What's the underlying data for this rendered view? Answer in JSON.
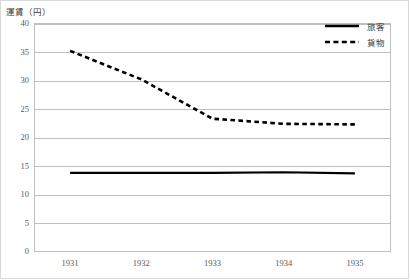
{
  "chart_data": {
    "type": "line",
    "title": "",
    "ylabel": "運賃（円）",
    "xlabel": "",
    "categories": [
      "1931",
      "1932",
      "1933",
      "1934",
      "1935"
    ],
    "x": [
      1931,
      1932,
      1933,
      1934,
      1935
    ],
    "ylim": [
      0,
      40
    ],
    "ytick_values": [
      0,
      5,
      10,
      15,
      20,
      25,
      30,
      35,
      40
    ],
    "ytick_labels": [
      "0",
      "5",
      "10",
      "15",
      "20",
      "25",
      "30",
      "35",
      "40"
    ],
    "grid": "horizontal",
    "legend_position": "top-right",
    "series": [
      {
        "name": "旅客",
        "style": "solid",
        "color": "#000000",
        "values": [
          13.8,
          13.8,
          13.8,
          13.9,
          13.7
        ]
      },
      {
        "name": "貨物",
        "style": "dashed",
        "color": "#000000",
        "values": [
          35.2,
          30.2,
          23.3,
          22.4,
          22.3
        ]
      }
    ]
  },
  "legend": {
    "items": [
      {
        "label": "旅客",
        "style": "solid"
      },
      {
        "label": "貨物",
        "style": "dashed"
      }
    ]
  }
}
